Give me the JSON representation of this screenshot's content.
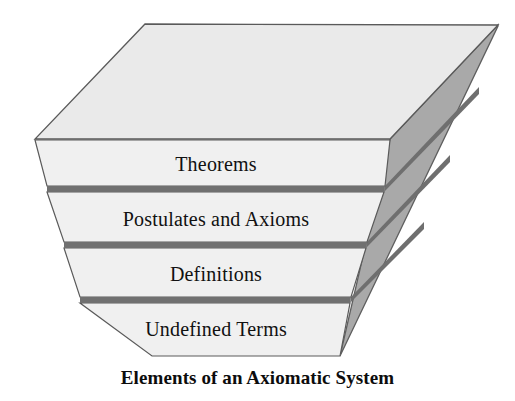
{
  "figure": {
    "caption": "Elements of an Axiomatic System",
    "type": "3d-layered-trapezoid-diagram",
    "layers": [
      {
        "label": "Theorems",
        "order": 1,
        "position": "top"
      },
      {
        "label": "Postulates and Axioms",
        "order": 2,
        "position": "upper-middle"
      },
      {
        "label": "Definitions",
        "order": 3,
        "position": "lower-middle"
      },
      {
        "label": "Undefined Terms",
        "order": 4,
        "position": "bottom"
      }
    ],
    "colors": {
      "front_face": "#efefef",
      "top_face": "#e8e8e8",
      "side_face": "#a9a9a9",
      "side_face_shadow": "#8f8f8f",
      "outline": "#5a5a5a",
      "divider": "#6e6e6e",
      "text": "#111111",
      "background": "#ffffff"
    }
  }
}
